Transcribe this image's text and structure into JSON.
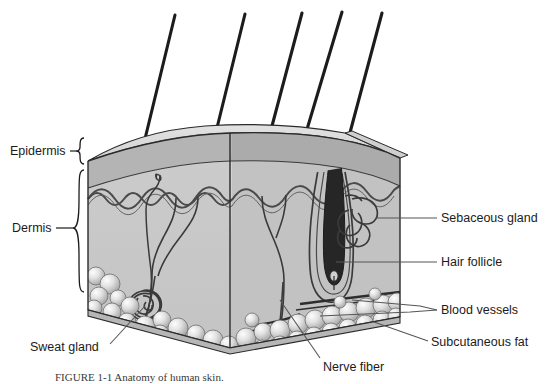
{
  "figure": {
    "caption": "FIGURE 1-1   Anatomy of human skin.",
    "type": "anatomical-cross-section-diagram"
  },
  "layer_labels": {
    "epidermis": "Epidermis",
    "dermis": "Dermis"
  },
  "structure_labels": {
    "sebaceous_gland": "Sebaceous gland",
    "hair_follicle": "Hair follicle",
    "blood_vessels": "Blood vessels",
    "subcutaneous_fat": "Subcutaneous fat",
    "nerve_fiber": "Nerve fiber",
    "sweat_gland": "Sweat gland"
  },
  "colors": {
    "top_surface": "#d9d9d9",
    "epidermis_front": "#b9b9b9",
    "dermis_front": "#c9c9c9",
    "dermis_side": "#b0b0b0",
    "fat_fill": "#d2d2d2",
    "outline": "#2a2a2a",
    "hair_shaft": "#1c1c1c",
    "leader_line": "#555555",
    "text": "#1b1b1b",
    "background": "#ffffff"
  },
  "counts": {
    "hair_shafts": 5,
    "nerve_branches": 2,
    "blood_vessel_lines": 3,
    "sebaceous_lobes": 3
  }
}
